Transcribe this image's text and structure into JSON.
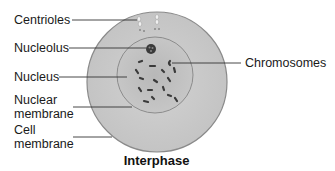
{
  "diagram": {
    "title": "Interphase",
    "labels": {
      "centrioles": "Centrioles",
      "nucleolus": "Nucleolus",
      "nucleus": "Nucleus",
      "nuclear_membrane_1": "Nuclear",
      "nuclear_membrane_2": "membrane",
      "cell_membrane_1": "Cell",
      "cell_membrane_2": "membrane",
      "chromosomes": "Chromosomes"
    },
    "colors": {
      "cytoplasm": "#c8c8c8",
      "nucleus": "#bcbcbc",
      "membrane": "#8a8a8a",
      "chromosome": "#3a3a3a",
      "leader_line": "#333333"
    }
  }
}
